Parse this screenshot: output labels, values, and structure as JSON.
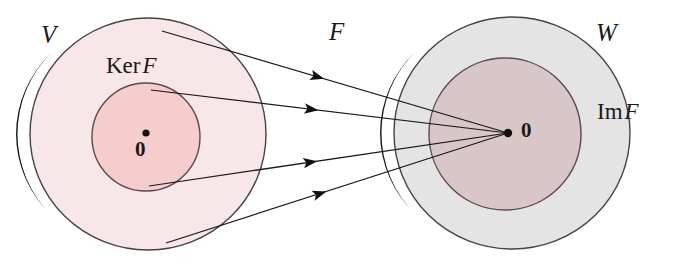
{
  "diagram": {
    "type": "set-mapping-diagram",
    "domain_set": {
      "name": "V",
      "role": "domain",
      "fill_color": "#f8e7e8",
      "stroke_color": "#4a4145",
      "rim_color": "#121212",
      "center": [
        148,
        134
      ],
      "rx": 118,
      "ry": 116
    },
    "kernel_set": {
      "name_roman": "Ker",
      "name_italic": "F",
      "full_label": "Ker F",
      "role": "kernel-subset",
      "fill_color": "#f6cdcd",
      "stroke_color": "#5a4a4d",
      "center": [
        146,
        137
      ],
      "r": 54
    },
    "codomain_set": {
      "name": "W",
      "role": "codomain",
      "fill_color": "#e4e4e4",
      "stroke_color": "#4a4145",
      "rim_color": "#121212",
      "center": [
        512,
        133
      ],
      "rx": 118,
      "ry": 116
    },
    "image_set": {
      "name_roman": "Im",
      "name_italic": "F",
      "full_label": "Im F",
      "role": "image-subset",
      "fill_color": "#d9c6c9",
      "stroke_color": "#5a4a4d",
      "center": [
        505,
        134
      ],
      "r": 76
    },
    "map_label": "F",
    "zero_domain": {
      "label": "0",
      "description": "zero vector of V, inside Ker F",
      "dot": [
        146,
        133
      ],
      "text_pos": [
        135,
        139
      ]
    },
    "zero_codomain": {
      "label": "0",
      "description": "zero vector of W, image of Ker F",
      "dot": [
        508,
        133
      ],
      "text_pos": [
        521,
        120
      ]
    },
    "arrows": [
      {
        "id": "arrow-1",
        "from": [
          162,
          31
        ],
        "to": [
          508,
          133
        ],
        "head_t": 0.43,
        "origin": "V-boundary-top"
      },
      {
        "id": "arrow-2",
        "from": [
          151,
          90
        ],
        "to": [
          508,
          133
        ],
        "head_t": 0.43,
        "origin": "KerF-boundary-top"
      },
      {
        "id": "arrow-3",
        "from": [
          149,
          186
        ],
        "to": [
          508,
          133
        ],
        "head_t": 0.43,
        "origin": "KerF-boundary-bottom"
      },
      {
        "id": "arrow-4",
        "from": [
          166,
          243
        ],
        "to": [
          508,
          133
        ],
        "head_t": 0.43,
        "origin": "V-boundary-bottom"
      }
    ],
    "stroke_color": "#1a1a1a",
    "background": "#ffffff"
  }
}
